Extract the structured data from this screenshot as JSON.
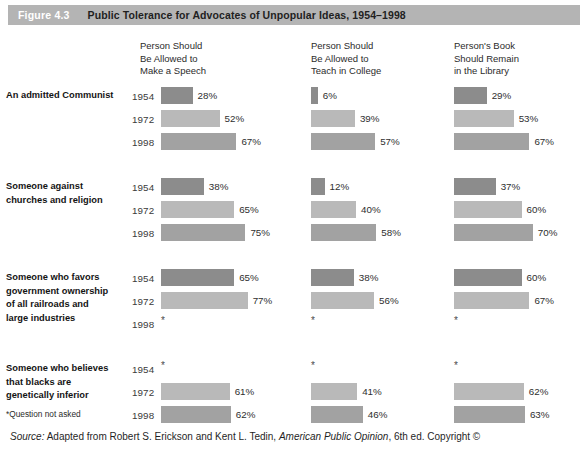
{
  "header": {
    "figure_number": "Figure 4.3",
    "title": "Public Tolerance for Advocates of Unpopular Ideas, 1954–1998",
    "band_color": "#b4b4b4"
  },
  "columns": [
    {
      "id": "speech",
      "line1": "Person Should",
      "line2": "Be Allowed to",
      "line3": "Make a Speech"
    },
    {
      "id": "teach",
      "line1": "Person Should",
      "line2": "Be Allowed to",
      "line3": "Teach in College"
    },
    {
      "id": "library",
      "line1": "Person's Book",
      "line2": "Should Remain",
      "line3": "in the Library"
    }
  ],
  "years": [
    "1954",
    "1972",
    "1998"
  ],
  "year_colors": [
    "#8c8c8c",
    "#b9b9b9",
    "#a2a2a2"
  ],
  "no_data_marker": "*",
  "groups": [
    {
      "label": "An admitted Communist",
      "label_lines": [
        "An admitted Communist"
      ],
      "rows": [
        {
          "year": "1954",
          "values": [
            28,
            6,
            29
          ],
          "labels": [
            "28%",
            "6%",
            "29%"
          ]
        },
        {
          "year": "1972",
          "values": [
            52,
            39,
            53
          ],
          "labels": [
            "52%",
            "39%",
            "53%"
          ]
        },
        {
          "year": "1998",
          "values": [
            67,
            57,
            67
          ],
          "labels": [
            "67%",
            "57%",
            "67%"
          ]
        }
      ]
    },
    {
      "label": "Someone against churches and religion",
      "label_lines": [
        "Someone against",
        "churches and religion"
      ],
      "rows": [
        {
          "year": "1954",
          "values": [
            38,
            12,
            37
          ],
          "labels": [
            "38%",
            "12%",
            "37%"
          ]
        },
        {
          "year": "1972",
          "values": [
            65,
            40,
            60
          ],
          "labels": [
            "65%",
            "40%",
            "60%"
          ]
        },
        {
          "year": "1998",
          "values": [
            75,
            58,
            70
          ],
          "labels": [
            "75%",
            "58%",
            "70%"
          ]
        }
      ]
    },
    {
      "label": "Someone who favors government ownership of all railroads and large industries",
      "label_lines": [
        "Someone who favors",
        "government ownership",
        "of all railroads and",
        "large industries"
      ],
      "rows": [
        {
          "year": "1954",
          "values": [
            65,
            38,
            60
          ],
          "labels": [
            "65%",
            "38%",
            "60%"
          ]
        },
        {
          "year": "1972",
          "values": [
            77,
            56,
            67
          ],
          "labels": [
            "77%",
            "56%",
            "67%"
          ]
        },
        {
          "year": "1998",
          "values": [
            null,
            null,
            null
          ],
          "labels": [
            "*",
            "*",
            "*"
          ]
        }
      ]
    },
    {
      "label": "Someone who believes that blacks are genetically inferior",
      "label_lines": [
        "Someone who believes",
        "that blacks are",
        "genetically inferior"
      ],
      "rows": [
        {
          "year": "1954",
          "values": [
            null,
            null,
            null
          ],
          "labels": [
            "*",
            "*",
            "*"
          ]
        },
        {
          "year": "1972",
          "values": [
            61,
            41,
            62
          ],
          "labels": [
            "61%",
            "41%",
            "62%"
          ]
        },
        {
          "year": "1998",
          "values": [
            62,
            46,
            63
          ],
          "labels": [
            "62%",
            "46%",
            "63%"
          ]
        }
      ]
    }
  ],
  "footnote": "*Question not asked",
  "source": {
    "prefix": "Source:",
    "text_before": " Adapted from Robert S. Erickson and Kent L. Tedin, ",
    "italic_title": "American Public Opinion",
    "text_after": ", 6th ed. Copyright ©"
  },
  "chart_data": {
    "type": "bar",
    "title": "Public Tolerance for Advocates of Unpopular Ideas, 1954–1998",
    "xlabel": "",
    "ylabel": "",
    "xlim": [
      0,
      100
    ],
    "grid": false,
    "legend": "none",
    "orientation": "horizontal",
    "categories": [
      "An admitted Communist",
      "Someone against churches and religion",
      "Someone who favors government ownership of all railroads and large industries",
      "Someone who believes that blacks are genetically inferior"
    ],
    "panels": [
      "Person Should Be Allowed to Make a Speech",
      "Person Should Be Allowed to Teach in College",
      "Person's Book Should Remain in the Library"
    ],
    "series": [
      {
        "name": "1954",
        "Person Should Be Allowed to Make a Speech": [
          28,
          38,
          65,
          null
        ],
        "Person Should Be Allowed to Teach in College": [
          6,
          12,
          38,
          null
        ],
        "Person's Book Should Remain in the Library": [
          29,
          37,
          60,
          null
        ]
      },
      {
        "name": "1972",
        "Person Should Be Allowed to Make a Speech": [
          52,
          65,
          77,
          61
        ],
        "Person Should Be Allowed to Teach in College": [
          39,
          40,
          56,
          41
        ],
        "Person's Book Should Remain in the Library": [
          53,
          60,
          67,
          62
        ]
      },
      {
        "name": "1998",
        "Person Should Be Allowed to Make a Speech": [
          67,
          75,
          null,
          62
        ],
        "Person Should Be Allowed to Teach in College": [
          57,
          58,
          null,
          46
        ],
        "Person's Book Should Remain in the Library": [
          67,
          70,
          null,
          63
        ]
      }
    ],
    "units": "percent",
    "missing_marker": "*",
    "missing_note": "*Question not asked"
  }
}
